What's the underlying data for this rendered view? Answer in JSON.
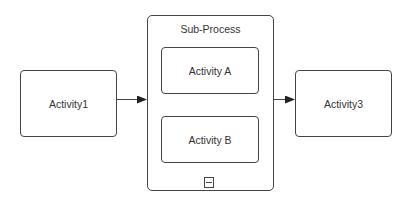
{
  "diagram": {
    "type": "BPMN process",
    "nodes": [
      {
        "id": "activity1",
        "label": "Activity1",
        "kind": "task"
      },
      {
        "id": "subprocess",
        "label": "Sub-Process",
        "kind": "expanded-subprocess",
        "children": [
          {
            "id": "activityA",
            "label": "Activity A",
            "kind": "task"
          },
          {
            "id": "activityB",
            "label": "Activity B",
            "kind": "task"
          }
        ],
        "marker": "collapse-marker-icon"
      },
      {
        "id": "activity3",
        "label": "Activity3",
        "kind": "task"
      }
    ],
    "edges": [
      {
        "from": "activity1",
        "to": "subprocess"
      },
      {
        "from": "subprocess",
        "to": "activity3"
      }
    ],
    "colors": {
      "stroke": "#444444",
      "text": "#333333",
      "background": "#ffffff"
    }
  }
}
